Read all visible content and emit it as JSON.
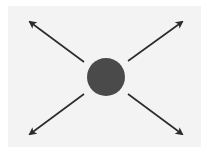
{
  "diagram": {
    "background": "#f3f3f3",
    "center_node": {
      "cx": 106,
      "cy": 77,
      "r": 19,
      "fill": "#4a4a4a"
    },
    "arrows": [
      {
        "name": "arrow-up-left",
        "x1": 84,
        "y1": 62,
        "x2": 30,
        "y2": 22
      },
      {
        "name": "arrow-up-right",
        "x1": 128,
        "y1": 61,
        "x2": 182,
        "y2": 22
      },
      {
        "name": "arrow-down-left",
        "x1": 84,
        "y1": 94,
        "x2": 30,
        "y2": 134
      },
      {
        "name": "arrow-down-right",
        "x1": 128,
        "y1": 94,
        "x2": 182,
        "y2": 134
      }
    ],
    "arrow_color": "#2b2b2b"
  }
}
